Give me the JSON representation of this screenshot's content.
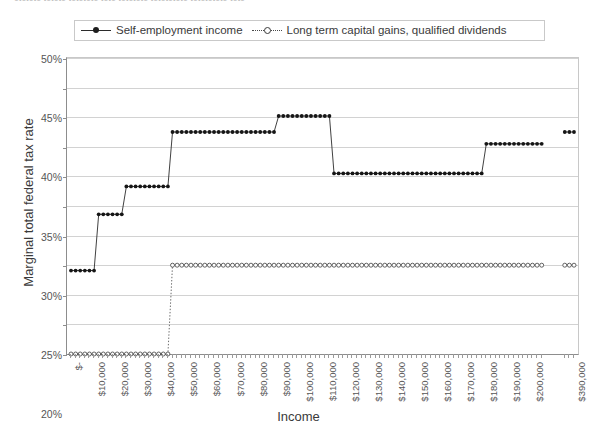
{
  "top_caption": "ctctctc tctctc tctctctc tctc tctctctc tctctctctc tctctctctc tctc",
  "legend": {
    "position": "top",
    "entries": [
      {
        "label": "Self-employment income",
        "key": "solid-line-filled-marker",
        "color": "#1d1d1d"
      },
      {
        "label": "Long term capital gains, qualified dividends",
        "key": "dotted-line-open-marker",
        "color": "#4a4a4a"
      }
    ]
  },
  "axes": {
    "x_title": "Income",
    "y_title": "Marginal total federal tax rate"
  },
  "chart_data": {
    "type": "line",
    "title": "",
    "xlabel": "Income",
    "ylabel": "Marginal total federal tax rate",
    "ylim": [
      0,
      50
    ],
    "y_unit": "%",
    "grid": true,
    "legend_position": "top",
    "y_ticks": [
      "0%",
      "5%",
      "10%",
      "15%",
      "20%",
      "25%",
      "30%",
      "35%",
      "40%",
      "45%",
      "50%"
    ],
    "y_tick_values": [
      0,
      5,
      10,
      15,
      20,
      25,
      30,
      35,
      40,
      45,
      50
    ],
    "x_tick_labels": [
      "$-",
      "$10,000",
      "$20,000",
      "$30,000",
      "$40,000",
      "$50,000",
      "$60,000",
      "$70,000",
      "$80,000",
      "$90,000",
      "$100,000",
      "$110,000",
      "$120,000",
      "$130,000",
      "$140,000",
      "$150,000",
      "$160,000",
      "$170,000",
      "$180,000",
      "$190,000",
      "$200,000",
      "$390,000"
    ],
    "x_tick_positions": [
      0,
      10000,
      20000,
      30000,
      40000,
      50000,
      60000,
      70000,
      80000,
      90000,
      100000,
      110000,
      120000,
      130000,
      140000,
      150000,
      160000,
      170000,
      180000,
      190000,
      200000,
      390000
    ],
    "x_axis_note": "Axis is categorical; data sampled every $2,000 from $0 to ~$204,000, then a break, then points near $386,000-$390,000.",
    "series": [
      {
        "name": "Self-employment income",
        "style": "solid",
        "marker": "filled-circle",
        "steps": [
          {
            "x_start": 0,
            "x_end": 10000,
            "value": 14.1
          },
          {
            "x_start": 12000,
            "x_end": 22000,
            "value": 23.6
          },
          {
            "x_start": 24000,
            "x_end": 42000,
            "value": 28.3
          },
          {
            "x_start": 44000,
            "x_end": 88000,
            "value": 37.5
          },
          {
            "x_start": 90000,
            "x_end": 112000,
            "value": 40.2
          },
          {
            "x_start": 114000,
            "x_end": 178000,
            "value": 30.5
          },
          {
            "x_start": 180000,
            "x_end": 204000,
            "value": 35.5
          },
          {
            "x_start": 386000,
            "x_end": 390000,
            "value": 37.5
          }
        ]
      },
      {
        "name": "Long term capital gains, qualified dividends",
        "style": "dotted",
        "marker": "open-circle",
        "steps": [
          {
            "x_start": 0,
            "x_end": 42000,
            "value": 0
          },
          {
            "x_start": 44000,
            "x_end": 204000,
            "value": 15
          },
          {
            "x_start": 386000,
            "x_end": 390000,
            "value": 15
          }
        ]
      }
    ]
  }
}
